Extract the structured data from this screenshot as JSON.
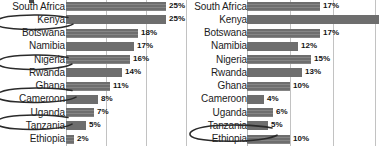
{
  "chart_data": [
    {
      "type": "bar",
      "orientation": "horizontal",
      "panel": "left",
      "title": "",
      "xlabel": "",
      "ylabel": "",
      "xlim": [
        0,
        30
      ],
      "grid": true,
      "gridlines": [
        0,
        10,
        20,
        30
      ],
      "value_suffix": "%",
      "categories": [
        "South Africa",
        "Kenya",
        "Botswana",
        "Namibia",
        "Nigeria",
        "Rwanda",
        "Ghana",
        "Cameroon",
        "Uganda",
        "Tanzania",
        "Ethiopia"
      ],
      "values": [
        25,
        25,
        18,
        17,
        16,
        14,
        11,
        8,
        7,
        5,
        2
      ],
      "labels": [
        "25%",
        "25%",
        "18%",
        "17%",
        "16%",
        "14%",
        "11%",
        "8%",
        "7%",
        "5%",
        "2%"
      ],
      "annotations": [
        {
          "type": "hand-drawn-ellipse",
          "target": "Kenya"
        },
        {
          "type": "hand-drawn-ellipse",
          "target": "Nigeria"
        },
        {
          "type": "hand-drawn-ellipse",
          "target": "Cameroon"
        },
        {
          "type": "hand-drawn-ellipse",
          "target": "Tanzania"
        }
      ]
    },
    {
      "type": "bar",
      "orientation": "horizontal",
      "panel": "right",
      "title": "",
      "xlabel": "",
      "ylabel": "",
      "xlim": [
        0,
        30
      ],
      "grid": true,
      "gridlines": [
        0,
        10,
        20,
        30
      ],
      "value_suffix": "%",
      "categories": [
        "South Africa",
        "Kenya",
        "Botswana",
        "Namibia",
        "Nigeria",
        "Rwanda",
        "Ghana",
        "Cameroon",
        "Uganda",
        "Tanzania",
        "Ethiopia"
      ],
      "values": [
        17,
        22,
        17,
        12,
        15,
        13,
        10,
        4,
        6,
        5,
        10
      ],
      "labels": [
        "17%",
        "",
        "17%",
        "12%",
        "15%",
        "13%",
        "10%",
        "4%",
        "6%",
        "5%",
        "10%"
      ],
      "annotations": [
        {
          "type": "hand-drawn-ellipse",
          "target": "Ethiopia"
        }
      ]
    }
  ],
  "left": {
    "rows": [
      {
        "label": "South Africa",
        "value": "25%"
      },
      {
        "label": "Kenya",
        "value": "25%"
      },
      {
        "label": "Botswana",
        "value": "18%"
      },
      {
        "label": "Namibia",
        "value": "17%"
      },
      {
        "label": "Nigeria",
        "value": "16%"
      },
      {
        "label": "Rwanda",
        "value": "14%"
      },
      {
        "label": "Ghana",
        "value": "11%"
      },
      {
        "label": "Cameroon",
        "value": "8%"
      },
      {
        "label": "Uganda",
        "value": "7%"
      },
      {
        "label": "Tanzania",
        "value": "5%"
      },
      {
        "label": "Ethiopia",
        "value": "2%"
      }
    ]
  },
  "right": {
    "rows": [
      {
        "label": "South Africa",
        "value": "17%"
      },
      {
        "label": "Kenya",
        "value": ""
      },
      {
        "label": "Botswana",
        "value": "17%"
      },
      {
        "label": "Namibia",
        "value": "12%"
      },
      {
        "label": "Nigeria",
        "value": "15%"
      },
      {
        "label": "Rwanda",
        "value": "13%"
      },
      {
        "label": "Ghana",
        "value": "10%"
      },
      {
        "label": "Cameroon",
        "value": "4%"
      },
      {
        "label": "Uganda",
        "value": "6%"
      },
      {
        "label": "Tanzania",
        "value": "5%"
      },
      {
        "label": "Ethiopia",
        "value": "10%"
      }
    ]
  },
  "colors": {
    "bar": "#6e6e6e",
    "gridline": "#c2c2c2",
    "text": "#1c1c1c",
    "annotation": "#2a2a2a",
    "background": "#ffffff"
  }
}
